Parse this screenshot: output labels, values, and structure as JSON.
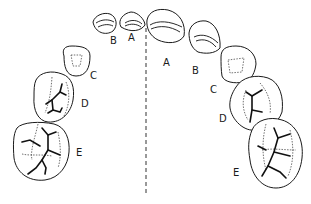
{
  "diagram": {
    "type": "dental occlusal view of primary teeth arch",
    "midline": "dashed vertical line",
    "left_side": {
      "labels": [
        "A",
        "B",
        "C",
        "D",
        "E"
      ]
    },
    "right_side": {
      "labels": [
        "A",
        "B",
        "C",
        "D",
        "E"
      ]
    }
  }
}
